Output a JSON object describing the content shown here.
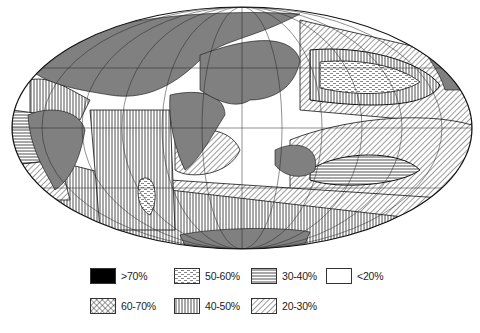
{
  "map": {
    "projection": "elliptical world map",
    "land_color": "#808080",
    "ocean_base_color": "#ffffff",
    "outline_color": "#111111"
  },
  "legend": {
    "items": [
      {
        "label": ">70%",
        "pattern": "solid-black"
      },
      {
        "label": "50-60%",
        "pattern": "dashes"
      },
      {
        "label": "30-40%",
        "pattern": "horizontal-lines"
      },
      {
        "label": "<20%",
        "pattern": "blank"
      },
      {
        "label": "60-70%",
        "pattern": "crosshatch"
      },
      {
        "label": "40-50%",
        "pattern": "vertical-lines"
      },
      {
        "label": "20-30%",
        "pattern": "diagonal-lines"
      }
    ]
  }
}
